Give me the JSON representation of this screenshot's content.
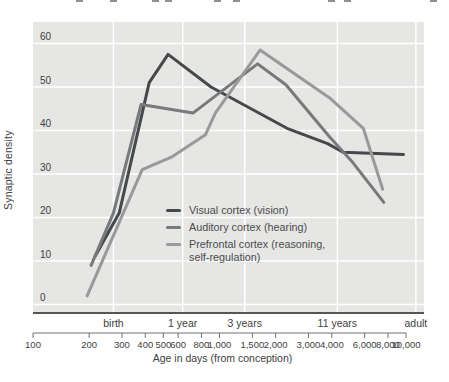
{
  "figure_title": "",
  "colors": {
    "visual": "#46494c",
    "auditory": "#77797c",
    "prefrontal": "#97999b",
    "plot_bg": "#e6e6e5",
    "grid": "#ffffff",
    "axis_line": "#54565a",
    "ruler": "#6f7174",
    "text": "#3e4042"
  },
  "legend": {
    "items": [
      {
        "key": "visual",
        "label": "Visual cortex (vision)",
        "label2": ""
      },
      {
        "key": "auditory",
        "label": "Auditory cortex (hearing)",
        "label2": ""
      },
      {
        "key": "prefrontal",
        "label": "Prefrontal cortex (reasoning,",
        "label2": "self-regulation)"
      }
    ]
  },
  "chart_data": {
    "type": "line",
    "title": "",
    "xlabel": "Age in days (from conception)",
    "ylabel": "Synaptic density",
    "x_scale": "log",
    "x_range_days": [
      100,
      10000
    ],
    "ylim": [
      0,
      60
    ],
    "grid": "on",
    "y_ticks": [
      0,
      10,
      20,
      30,
      40,
      50,
      60
    ],
    "y_tick_labels": [
      "0",
      "10",
      "20",
      "30",
      "40",
      "50",
      "60"
    ],
    "x_ticks_days": [
      100,
      200,
      300,
      400,
      500,
      600,
      800,
      1000,
      1500,
      2000,
      3000,
      4000,
      6000,
      8000,
      10000
    ],
    "x_tick_labels": [
      "100",
      "200",
      "300",
      "400",
      "500",
      "600",
      "800",
      "1,000",
      "1,500",
      "2,000",
      "3,000",
      "4,000",
      "6,000",
      "8,000",
      "10,000"
    ],
    "age_markers": [
      {
        "label": "birth",
        "days": 270
      },
      {
        "label": "1 year",
        "days": 635
      },
      {
        "label": "3 years",
        "days": 1365
      },
      {
        "label": "11 years",
        "days": 4285
      },
      {
        "label": "adult",
        "days": 11300
      }
    ],
    "series": [
      {
        "name": "Visual cortex (vision)",
        "key": "visual",
        "days": [
          215,
          290,
          420,
          530,
          900,
          2300,
          3800,
          4600,
          9700
        ],
        "values": [
          11,
          21,
          51,
          57.5,
          50,
          40.5,
          37,
          35,
          34.5
        ]
      },
      {
        "name": "Auditory cortex (hearing)",
        "key": "auditory",
        "days": [
          205,
          270,
          380,
          720,
          1600,
          2270,
          3900,
          5100,
          7600
        ],
        "values": [
          9,
          21,
          46,
          44,
          55.3,
          50.5,
          38.5,
          33,
          23.5
        ]
      },
      {
        "name": "Prefrontal cortex (reasoning, self-regulation)",
        "key": "prefrontal",
        "days": [
          195,
          385,
          560,
          840,
          950,
          1650,
          3900,
          5900,
          7500
        ],
        "values": [
          2,
          31,
          34,
          39,
          44,
          58.5,
          47.5,
          40.5,
          26.5
        ]
      }
    ]
  },
  "crop_artifact_x": [
    76,
    110,
    152,
    165,
    214,
    233,
    328,
    344,
    430
  ]
}
